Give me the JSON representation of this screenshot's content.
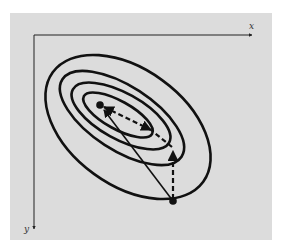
{
  "figure": {
    "background_color": "#dcdcdc",
    "line_color": "#111111",
    "axes": {
      "x_label": "x",
      "y_label": "y"
    },
    "contours": {
      "count": 4,
      "description": "Nested elliptical contour lines of a function, elongated diagonally"
    },
    "points": [
      {
        "name": "optimum",
        "role": "center of contours"
      },
      {
        "name": "start",
        "role": "starting point below contours"
      }
    ],
    "paths": [
      {
        "name": "direct-step",
        "style": "solid",
        "from": "start",
        "to": "optimum"
      },
      {
        "name": "zigzag-step-1",
        "style": "dashed",
        "direction": "vertical up from start"
      },
      {
        "name": "zigzag-step-2",
        "style": "dashed",
        "direction": "diagonal toward optimum"
      }
    ]
  }
}
